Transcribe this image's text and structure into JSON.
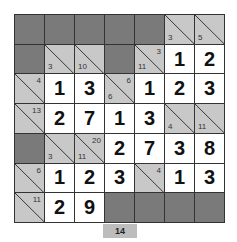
{
  "puzzle": {
    "type": "kakuro",
    "rows": 7,
    "cols": 7,
    "colors": {
      "dark": "#7a7a7a",
      "clue": "#c8c8c8",
      "white": "#ffffff",
      "border": "#333333"
    },
    "cells": [
      [
        {
          "t": "d"
        },
        {
          "t": "d"
        },
        {
          "t": "d"
        },
        {
          "t": "d"
        },
        {
          "t": "d"
        },
        {
          "t": "c",
          "down": "3"
        },
        {
          "t": "c",
          "down": "5"
        }
      ],
      [
        {
          "t": "d"
        },
        {
          "t": "c",
          "down": "3"
        },
        {
          "t": "c",
          "down": "10"
        },
        {
          "t": "d"
        },
        {
          "t": "c",
          "across": "3",
          "down": "11"
        },
        {
          "t": "w",
          "v": "1"
        },
        {
          "t": "w",
          "v": "2"
        }
      ],
      [
        {
          "t": "c",
          "across": "4"
        },
        {
          "t": "w",
          "v": "1"
        },
        {
          "t": "w",
          "v": "3"
        },
        {
          "t": "c",
          "across": "6",
          "down": "6"
        },
        {
          "t": "w",
          "v": "1"
        },
        {
          "t": "w",
          "v": "2"
        },
        {
          "t": "w",
          "v": "3"
        }
      ],
      [
        {
          "t": "c",
          "across": "13"
        },
        {
          "t": "w",
          "v": "2"
        },
        {
          "t": "w",
          "v": "7"
        },
        {
          "t": "w",
          "v": "1"
        },
        {
          "t": "w",
          "v": "3"
        },
        {
          "t": "c",
          "down": "4"
        },
        {
          "t": "c",
          "down": "11"
        }
      ],
      [
        {
          "t": "d"
        },
        {
          "t": "c",
          "down": "3"
        },
        {
          "t": "c",
          "across": "20",
          "down": "11"
        },
        {
          "t": "w",
          "v": "2"
        },
        {
          "t": "w",
          "v": "7"
        },
        {
          "t": "w",
          "v": "3"
        },
        {
          "t": "w",
          "v": "8"
        }
      ],
      [
        {
          "t": "c",
          "across": "6"
        },
        {
          "t": "w",
          "v": "1"
        },
        {
          "t": "w",
          "v": "2"
        },
        {
          "t": "w",
          "v": "3"
        },
        {
          "t": "c",
          "across": "4"
        },
        {
          "t": "w",
          "v": "1"
        },
        {
          "t": "w",
          "v": "3"
        }
      ],
      [
        {
          "t": "c",
          "across": "11"
        },
        {
          "t": "w",
          "v": "2"
        },
        {
          "t": "w",
          "v": "9"
        },
        {
          "t": "d"
        },
        {
          "t": "d"
        },
        {
          "t": "d"
        },
        {
          "t": "d"
        }
      ]
    ]
  },
  "footer": {
    "label": "14"
  }
}
